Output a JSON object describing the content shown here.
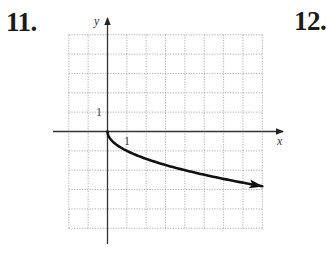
{
  "problems": {
    "left_number": "11.",
    "right_number": "12."
  },
  "colors": {
    "grid": "#a8a8a8",
    "axis": "#333333",
    "curve": "#111111",
    "text": "#1a1a1a"
  },
  "chart_data": {
    "type": "line",
    "title": "",
    "xlabel": "x",
    "ylabel": "y",
    "xlim": [
      -2,
      8
    ],
    "ylim": [
      -5,
      5
    ],
    "grid": true,
    "tick_labels": {
      "x": [
        "1"
      ],
      "y": [
        "1"
      ]
    },
    "series": [
      {
        "name": "y = -sqrt(x)",
        "x": [
          0,
          0.25,
          1,
          2,
          3,
          4,
          5,
          6,
          7,
          8
        ],
        "y": [
          0,
          -0.5,
          -1,
          -1.41,
          -1.73,
          -2,
          -2.24,
          -2.45,
          -2.65,
          -2.83
        ],
        "end_arrow": true
      }
    ],
    "legend": null
  }
}
